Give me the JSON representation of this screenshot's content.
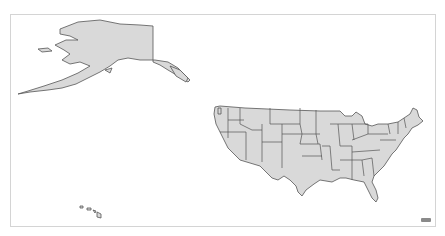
{
  "map": {
    "title": "United States",
    "fill_color": "#d9d9d9",
    "stroke_color": "#555555",
    "background": "#ffffff",
    "frame_color": "#d4d4d4",
    "regions": [
      {
        "id": "alaska",
        "label": "Alaska"
      },
      {
        "id": "hawaii",
        "label": "Hawaii"
      },
      {
        "id": "contiguous-us",
        "label": "Contiguous United States"
      }
    ],
    "attribution_icon": "map-logo-icon"
  }
}
